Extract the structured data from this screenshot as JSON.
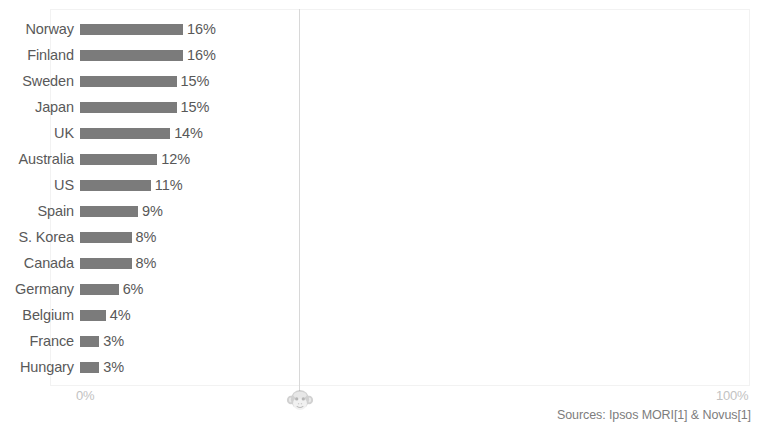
{
  "chart_data": {
    "type": "bar",
    "orientation": "horizontal",
    "title": "",
    "subtitle": "",
    "xlabel": "",
    "ylabel": "",
    "xlim": [
      0,
      100
    ],
    "grid": false,
    "legend": null,
    "categories": [
      "Norway",
      "Finland",
      "Sweden",
      "Japan",
      "UK",
      "Australia",
      "US",
      "Spain",
      "S. Korea",
      "Canada",
      "Germany",
      "Belgium",
      "France",
      "Hungary"
    ],
    "values": [
      16,
      16,
      15,
      15,
      14,
      12,
      11,
      9,
      8,
      8,
      6,
      4,
      3,
      3
    ],
    "value_labels": [
      "16%",
      "16%",
      "15%",
      "15%",
      "14%",
      "12%",
      "11%",
      "9%",
      "8%",
      "8%",
      "6%",
      "4%",
      "3%",
      "3%"
    ],
    "tick_labels": {
      "min": "0%",
      "max": "100%"
    },
    "bar_color": "#7b7b7b",
    "label_color": "#595959",
    "tick_color": "#c2c2c2",
    "annotation": "Sources: Ipsos MORI[1] & Novus[1]"
  },
  "icons": {
    "watermark": "monkey-face-icon"
  }
}
